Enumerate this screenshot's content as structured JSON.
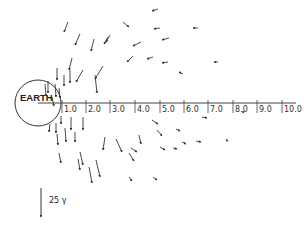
{
  "diagram": {
    "earth_label": "EARTH",
    "axis_ticks": [
      {
        "label": "1.0",
        "x": 62
      },
      {
        "label": "2.0",
        "x": 86
      },
      {
        "label": "3.0",
        "x": 110
      },
      {
        "label": "4.0",
        "x": 135
      },
      {
        "label": "5.0",
        "x": 160
      },
      {
        "label": "6.0",
        "x": 184
      },
      {
        "label": "7.0",
        "x": 208
      },
      {
        "label": "8.0",
        "x": 233
      },
      {
        "label": "9.0",
        "x": 257
      },
      {
        "label": "10.0",
        "x": 282
      }
    ],
    "scale_label": "25 γ",
    "colors": {
      "ink": "#333333",
      "background": "#ffffff"
    }
  }
}
